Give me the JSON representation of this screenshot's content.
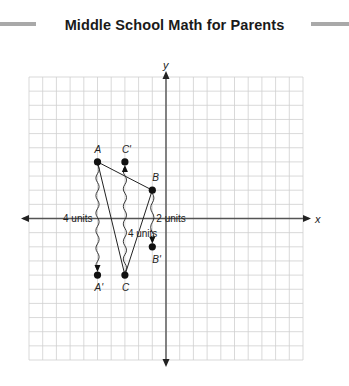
{
  "header": {
    "title": "Middle School Math for Parents"
  },
  "diagram": {
    "axes": {
      "x_label": "x",
      "y_label": "y"
    },
    "grid": {
      "x_min": -10,
      "x_max": 10,
      "y_min": -10,
      "y_max": 10,
      "step": 1
    },
    "colors": {
      "grid": "#cfcfcf",
      "axis": "#555555",
      "shape": "#222222",
      "point": "#111111"
    },
    "points": [
      {
        "name": "A",
        "x": -5,
        "y": 4,
        "label_dx": -3,
        "label_dy": -9
      },
      {
        "name": "B",
        "x": -1,
        "y": 2,
        "label_dx": 0,
        "label_dy": -9
      },
      {
        "name": "C",
        "x": -3,
        "y": -4,
        "label_dx": -3,
        "label_dy": 16
      },
      {
        "name": "A'",
        "x": -5,
        "y": -4,
        "label_dx": -3,
        "label_dy": 16
      },
      {
        "name": "B'",
        "x": -1,
        "y": -2,
        "label_dx": 0,
        "label_dy": 16
      },
      {
        "name": "C'",
        "x": -3,
        "y": 4,
        "label_dx": -3,
        "label_dy": -9
      }
    ],
    "triangle": [
      "A",
      "B",
      "C"
    ],
    "translations": [
      {
        "from": "A",
        "to": "A'",
        "label": "4 units",
        "label_side": "left"
      },
      {
        "from": "C",
        "to": "C'",
        "label": "4 units",
        "label_side": "right"
      },
      {
        "from": "B",
        "to": "B'",
        "label": "2 units",
        "label_side": "right"
      }
    ]
  }
}
